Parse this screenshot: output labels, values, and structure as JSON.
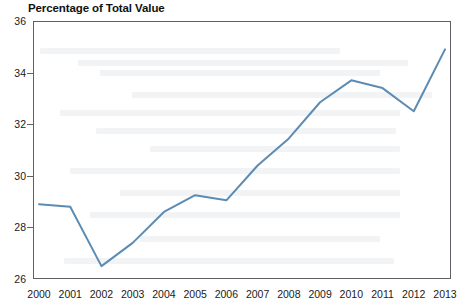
{
  "chart_data": {
    "type": "line",
    "title": "Percentage of Total Value",
    "xlabel": "",
    "ylabel": "",
    "categories": [
      "2000",
      "2001",
      "2002",
      "2003",
      "2004",
      "2005",
      "2006",
      "2007",
      "2008",
      "2009",
      "2010",
      "2011",
      "2012",
      "2013"
    ],
    "x": [
      2000,
      2001,
      2002,
      2003,
      2004,
      2005,
      2006,
      2007,
      2008,
      2009,
      2010,
      2011,
      2012,
      2013
    ],
    "values": [
      28.9,
      28.8,
      26.5,
      27.4,
      28.6,
      29.25,
      29.05,
      30.4,
      31.45,
      32.85,
      33.7,
      33.4,
      32.5,
      34.9
    ],
    "series": [
      {
        "name": "Percentage of Total Value",
        "values": [
          28.9,
          28.8,
          26.5,
          27.4,
          28.6,
          29.25,
          29.05,
          30.4,
          31.45,
          32.85,
          33.7,
          33.4,
          32.5,
          34.9
        ]
      }
    ],
    "ylim": [
      26,
      36
    ],
    "yticks": [
      26,
      28,
      30,
      32,
      34,
      36
    ],
    "ytick_labels": [
      "26",
      "28",
      "30",
      "32",
      "34",
      "36"
    ],
    "xtick_labels": [
      "2000",
      "2001",
      "2002",
      "2003",
      "2004",
      "2005",
      "2006",
      "2007",
      "2008",
      "2009",
      "2010",
      "2011",
      "2012",
      "2013"
    ],
    "grid": false,
    "legend": false,
    "legend_position": "none",
    "line_color": "#5c8cb4",
    "line_width": 2,
    "axis_color": "#5d6166",
    "background_color": "#ffffff",
    "annotations": []
  }
}
